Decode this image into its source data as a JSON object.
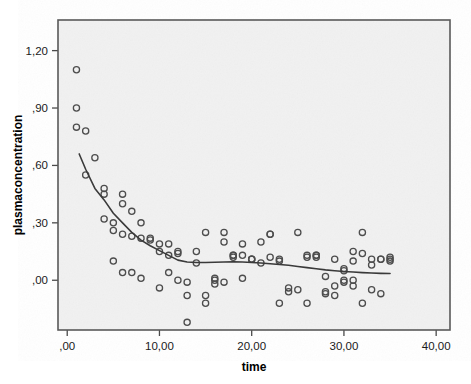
{
  "chart_data": {
    "type": "scatter",
    "title": "",
    "xlabel": "time",
    "ylabel": "plasmaconcentration",
    "xlim": [
      -1.0,
      41.5
    ],
    "ylim": [
      -0.26,
      1.36
    ],
    "grid": false,
    "legend": null,
    "x_ticks": [
      0,
      10,
      20,
      30,
      40
    ],
    "x_tick_labels": [
      ",00",
      "10,00",
      "20,00",
      "30,00",
      "40,00"
    ],
    "y_ticks": [
      0.0,
      0.3,
      0.6,
      0.9,
      1.2
    ],
    "y_tick_labels": [
      ",00",
      ",30",
      ",60",
      ",90",
      "1,20"
    ],
    "marker": "open-circle",
    "marker_color": "#4d4d4d",
    "points": [
      [
        1.0,
        1.1
      ],
      [
        1.0,
        0.9
      ],
      [
        1.0,
        0.8
      ],
      [
        2.0,
        0.78
      ],
      [
        3.0,
        0.64
      ],
      [
        2.0,
        0.55
      ],
      [
        4.0,
        0.48
      ],
      [
        4.0,
        0.45
      ],
      [
        6.0,
        0.45
      ],
      [
        6.0,
        0.4
      ],
      [
        7.0,
        0.36
      ],
      [
        4.0,
        0.32
      ],
      [
        5.0,
        0.3
      ],
      [
        8.0,
        0.3
      ],
      [
        5.0,
        0.26
      ],
      [
        6.0,
        0.24
      ],
      [
        7.0,
        0.23
      ],
      [
        9.0,
        0.22
      ],
      [
        10.0,
        0.19
      ],
      [
        11.0,
        0.19
      ],
      [
        10.0,
        0.15
      ],
      [
        12.0,
        0.15
      ],
      [
        11.0,
        0.13
      ],
      [
        12.0,
        0.14
      ],
      [
        14.0,
        0.15
      ],
      [
        15.0,
        0.25
      ],
      [
        17.0,
        0.25
      ],
      [
        17.0,
        0.2
      ],
      [
        18.0,
        0.13
      ],
      [
        18.0,
        0.13
      ],
      [
        19.0,
        0.13
      ],
      [
        20.0,
        0.11
      ],
      [
        20.0,
        0.11
      ],
      [
        21.0,
        0.09
      ],
      [
        19.0,
        0.19
      ],
      [
        21.0,
        0.2
      ],
      [
        22.0,
        0.24
      ],
      [
        22.0,
        0.12
      ],
      [
        22.0,
        0.24
      ],
      [
        23.0,
        0.11
      ],
      [
        23.0,
        0.1
      ],
      [
        25.0,
        0.25
      ],
      [
        26.0,
        0.13
      ],
      [
        27.0,
        0.13
      ],
      [
        27.0,
        0.13
      ],
      [
        29.0,
        0.11
      ],
      [
        30.0,
        0.06
      ],
      [
        30.0,
        0.05
      ],
      [
        31.0,
        0.1
      ],
      [
        31.0,
        0.15
      ],
      [
        32.0,
        0.25
      ],
      [
        32.0,
        0.14
      ],
      [
        33.0,
        0.11
      ],
      [
        33.0,
        0.08
      ],
      [
        34.0,
        0.11
      ],
      [
        35.0,
        0.11
      ],
      [
        35.0,
        0.12
      ],
      [
        5.0,
        0.1
      ],
      [
        6.0,
        0.04
      ],
      [
        7.0,
        0.04
      ],
      [
        8.0,
        0.01
      ],
      [
        11.0,
        0.04
      ],
      [
        10.0,
        -0.04
      ],
      [
        13.0,
        -0.08
      ],
      [
        12.0,
        0.0
      ],
      [
        13.0,
        -0.01
      ],
      [
        15.0,
        -0.08
      ],
      [
        15.0,
        -0.12
      ],
      [
        16.0,
        0.0
      ],
      [
        16.0,
        -0.02
      ],
      [
        17.0,
        -0.01
      ],
      [
        19.0,
        0.01
      ],
      [
        24.0,
        -0.04
      ],
      [
        24.0,
        -0.06
      ],
      [
        23.0,
        -0.12
      ],
      [
        25.0,
        -0.05
      ],
      [
        26.0,
        -0.12
      ],
      [
        28.0,
        -0.06
      ],
      [
        28.0,
        0.02
      ],
      [
        28.0,
        -0.07
      ],
      [
        29.0,
        -0.03
      ],
      [
        29.0,
        -0.08
      ],
      [
        30.0,
        -0.01
      ],
      [
        30.0,
        0.0
      ],
      [
        31.0,
        0.0
      ],
      [
        31.0,
        -0.03
      ],
      [
        32.0,
        -0.12
      ],
      [
        33.0,
        -0.05
      ],
      [
        34.0,
        -0.07
      ],
      [
        13.0,
        -0.22
      ],
      [
        9.0,
        0.21
      ],
      [
        8.0,
        0.22
      ],
      [
        14.0,
        0.09
      ],
      [
        16.0,
        0.01
      ],
      [
        18.0,
        0.12
      ],
      [
        20.0,
        0.11
      ],
      [
        26.0,
        0.12
      ],
      [
        27.0,
        0.12
      ],
      [
        34.0,
        0.11
      ],
      [
        35.0,
        0.1
      ]
    ],
    "fit_line": {
      "label": "loess-fit",
      "color": "#3a3a3a",
      "points": [
        [
          1.3,
          0.66
        ],
        [
          2.0,
          0.58
        ],
        [
          3.0,
          0.48
        ],
        [
          4.0,
          0.42
        ],
        [
          5.0,
          0.35
        ],
        [
          6.0,
          0.3
        ],
        [
          7.0,
          0.25
        ],
        [
          8.0,
          0.21
        ],
        [
          9.0,
          0.18
        ],
        [
          10.0,
          0.155
        ],
        [
          11.0,
          0.13
        ],
        [
          12.0,
          0.105
        ],
        [
          13.0,
          0.095
        ],
        [
          14.0,
          0.093
        ],
        [
          15.0,
          0.093
        ],
        [
          16.0,
          0.094
        ],
        [
          17.0,
          0.095
        ],
        [
          18.0,
          0.096
        ],
        [
          19.0,
          0.095
        ],
        [
          20.0,
          0.093
        ],
        [
          21.0,
          0.09
        ],
        [
          22.0,
          0.086
        ],
        [
          23.0,
          0.082
        ],
        [
          24.0,
          0.078
        ],
        [
          25.0,
          0.072
        ],
        [
          26.0,
          0.066
        ],
        [
          27.0,
          0.06
        ],
        [
          28.0,
          0.054
        ],
        [
          29.0,
          0.05
        ],
        [
          30.0,
          0.046
        ],
        [
          31.0,
          0.043
        ],
        [
          32.0,
          0.04
        ],
        [
          33.0,
          0.038
        ],
        [
          34.0,
          0.036
        ],
        [
          35.0,
          0.035
        ]
      ]
    }
  },
  "axes": {
    "x_title": "time",
    "y_title": "plasmaconcentration"
  },
  "colors": {
    "plot_background": "#f1f1f1",
    "page_background": "#ffffff",
    "frame": "#595959",
    "marker": "#4d4d4d",
    "fit_line": "#3a3a3a",
    "text": "#000000"
  }
}
